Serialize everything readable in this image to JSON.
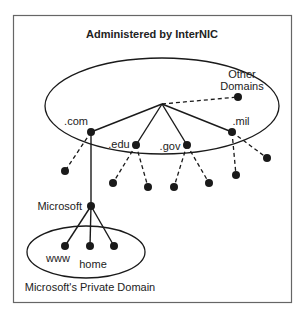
{
  "title": "Administered by InterNIC",
  "labels": {
    "other": [
      "Other",
      "Domains"
    ],
    "com": ".com",
    "edu": ".edu",
    "gov": ".gov",
    "mil": ".mil",
    "microsoft": "Microsoft",
    "www": "www",
    "home": "home",
    "private": "Microsoft's Private Domain"
  },
  "colors": {
    "ink": "#1a1a1a",
    "border": "#555555"
  }
}
